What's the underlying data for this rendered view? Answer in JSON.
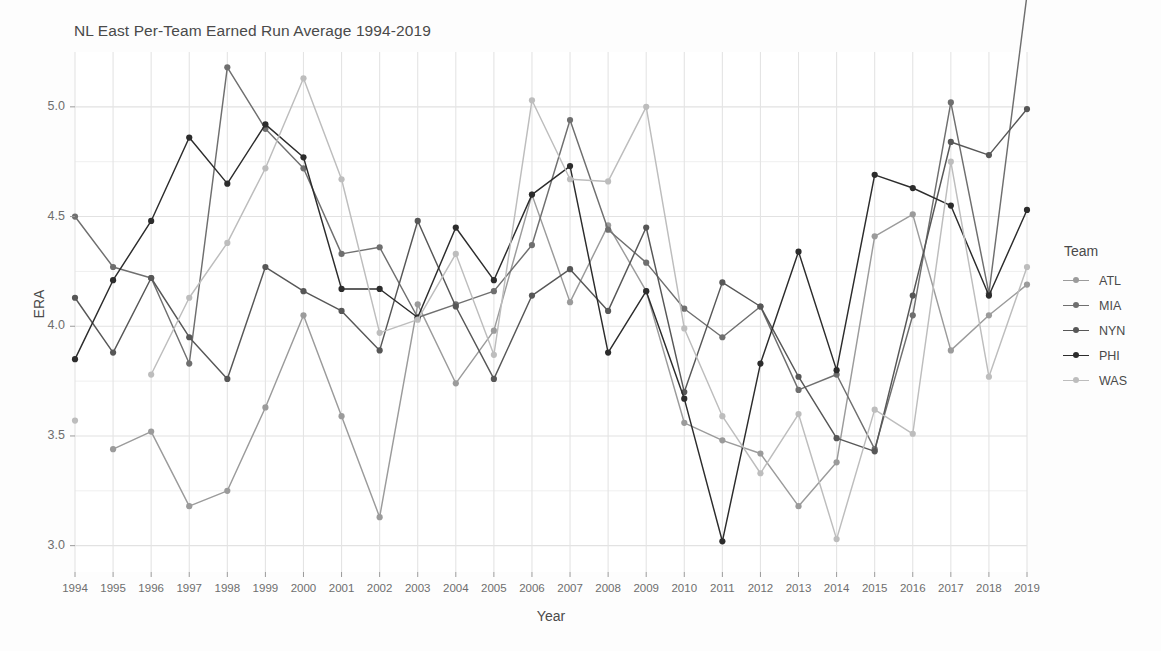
{
  "chart_data": {
    "type": "line",
    "title": "NL East Per-Team Earned Run Average 1994-2019",
    "xlabel": "Year",
    "ylabel": "ERA",
    "legend_title": "Team",
    "legend_position": "right",
    "grid": true,
    "xlim": [
      1994,
      2019
    ],
    "ylim": [
      2.88,
      5.25
    ],
    "yticks": [
      "3.0",
      "3.5",
      "4.0",
      "4.5",
      "5.0"
    ],
    "ytick_values": [
      3.0,
      3.5,
      4.0,
      4.5,
      5.0
    ],
    "y_minor_ticks": [
      3.25,
      3.75,
      4.25,
      4.75
    ],
    "categories": [
      1994,
      1995,
      1996,
      1997,
      1998,
      1999,
      2000,
      2001,
      2002,
      2003,
      2004,
      2005,
      2006,
      2007,
      2008,
      2009,
      2010,
      2011,
      2012,
      2013,
      2014,
      2015,
      2016,
      2017,
      2018,
      2019
    ],
    "xtick_labels": [
      "1994",
      "1995",
      "1996",
      "1997",
      "1998",
      "1999",
      "2000",
      "2001",
      "2002",
      "2003",
      "2004",
      "2005",
      "2006",
      "2007",
      "2008",
      "2009",
      "2010",
      "2011",
      "2012",
      "2013",
      "2014",
      "2015",
      "2016",
      "2017",
      "2018",
      "2019"
    ],
    "series": [
      {
        "name": "ATL",
        "color": "#9b9b9b",
        "values": [
          null,
          3.44,
          3.52,
          3.18,
          3.25,
          3.63,
          4.05,
          3.59,
          3.13,
          4.1,
          3.74,
          3.98,
          4.6,
          4.11,
          4.46,
          4.16,
          3.56,
          3.48,
          3.42,
          3.18,
          3.38,
          4.41,
          4.51,
          3.89,
          4.05,
          4.19
        ]
      },
      {
        "name": "MIA",
        "color": "#6f6f6f",
        "values": [
          4.5,
          4.27,
          4.22,
          3.83,
          5.18,
          4.9,
          4.72,
          4.33,
          4.36,
          4.04,
          4.1,
          4.16,
          4.37,
          4.94,
          4.44,
          4.29,
          4.08,
          3.95,
          4.09,
          3.71,
          3.78,
          3.44,
          4.05,
          5.02,
          4.15,
          5.51
        ]
      },
      {
        "name": "NYN",
        "color": "#575757",
        "values": [
          4.13,
          3.88,
          4.22,
          3.95,
          3.76,
          4.27,
          4.16,
          4.07,
          3.89,
          4.48,
          4.09,
          3.76,
          4.14,
          4.26,
          4.07,
          4.45,
          3.7,
          4.2,
          4.09,
          3.77,
          3.49,
          3.43,
          4.14,
          4.84,
          4.78,
          4.99
        ]
      },
      {
        "name": "PHI",
        "color": "#2c2c2c",
        "values": [
          3.85,
          4.21,
          4.48,
          4.86,
          4.65,
          4.92,
          4.77,
          4.17,
          4.17,
          4.04,
          4.45,
          4.21,
          4.6,
          4.73,
          3.88,
          4.16,
          3.67,
          3.02,
          3.83,
          4.34,
          3.8,
          4.69,
          4.63,
          4.55,
          4.14,
          4.53
        ]
      },
      {
        "name": "WAS",
        "color": "#bdbdbd",
        "values": [
          3.57,
          null,
          3.78,
          4.13,
          4.38,
          4.72,
          5.13,
          4.67,
          3.97,
          4.03,
          4.33,
          3.87,
          5.03,
          4.67,
          4.66,
          5.0,
          3.99,
          3.59,
          3.33,
          3.6,
          3.03,
          3.62,
          3.51,
          4.75,
          3.77,
          4.27
        ]
      }
    ]
  }
}
